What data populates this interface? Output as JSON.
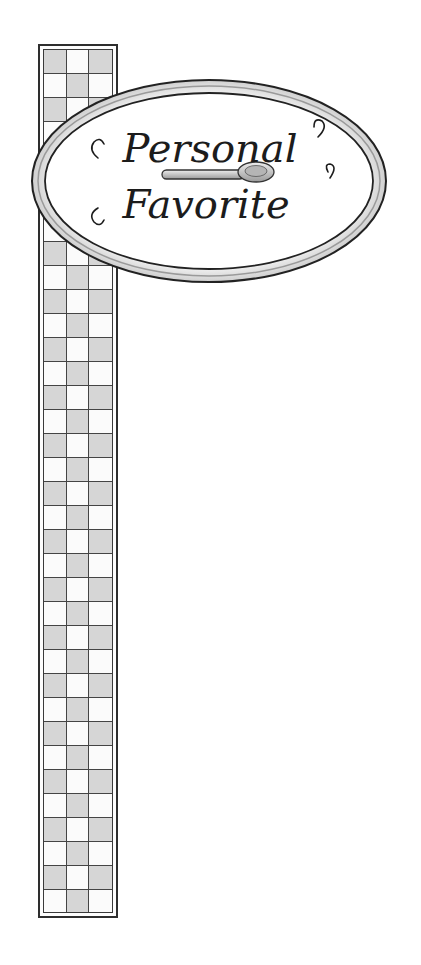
{
  "sign": {
    "line1": "Personal",
    "line2": "Favorite",
    "icon": "spoon-icon"
  },
  "column": {
    "pattern": "checkerboard",
    "columns": 3,
    "rows": 36
  },
  "colors": {
    "ink": "#1c1c1c",
    "shade": "#d6d6d6",
    "paper": "#ffffff"
  }
}
